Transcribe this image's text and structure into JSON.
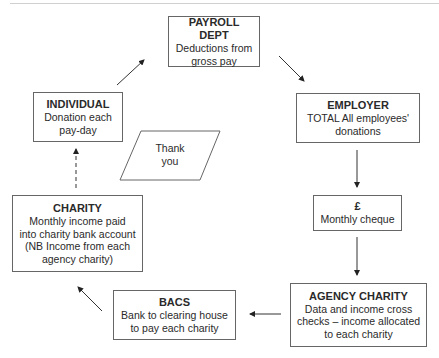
{
  "diagram": {
    "nodes": [
      {
        "id": "payroll",
        "title": "PAYROLL DEPT",
        "desc": "Deductions from\ngross pay"
      },
      {
        "id": "employer",
        "title": "EMPLOYER",
        "desc": "TOTAL All employees'\ndonations"
      },
      {
        "id": "cheque",
        "title": "£",
        "desc": "Monthly cheque"
      },
      {
        "id": "agency",
        "title": "AGENCY CHARITY",
        "desc": "Data and income cross\nchecks – income allocated\nto each charity"
      },
      {
        "id": "bacs",
        "title": "BACS",
        "desc": "Bank to clearing house\nto pay each charity"
      },
      {
        "id": "charity",
        "title": "CHARITY",
        "desc": "Monthly income paid\ninto charity bank account\n(NB Income from each\nagency charity)"
      },
      {
        "id": "individual",
        "title": "INDIVIDUAL",
        "desc": "Donation each\npay-day"
      }
    ],
    "thank_you": "Thank\nyou",
    "edges": [
      {
        "from": "individual",
        "to": "payroll",
        "style": "solid"
      },
      {
        "from": "payroll",
        "to": "employer",
        "style": "solid"
      },
      {
        "from": "employer",
        "to": "cheque",
        "style": "solid"
      },
      {
        "from": "cheque",
        "to": "agency",
        "style": "solid"
      },
      {
        "from": "agency",
        "to": "bacs",
        "style": "solid"
      },
      {
        "from": "bacs",
        "to": "charity",
        "style": "solid"
      },
      {
        "from": "charity",
        "to": "individual",
        "style": "dashed"
      }
    ],
    "line_color": "#333333"
  }
}
